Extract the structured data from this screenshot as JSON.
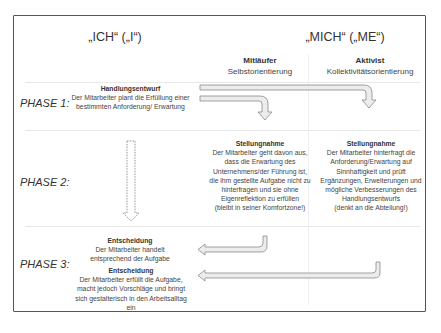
{
  "headers": {
    "ich": "„ICH“ („I“)",
    "mich": "„MICH“ („ME“)"
  },
  "columns": [
    {
      "title": "Mitläufer",
      "subtitle": "Selbstorientierung"
    },
    {
      "title": "Aktivist",
      "subtitle": "Kollektivitätsorientierung"
    }
  ],
  "phases": [
    {
      "label": "PHASE 1:"
    },
    {
      "label": "PHASE 2:"
    },
    {
      "label": "PHASE 3:"
    }
  ],
  "phase1": {
    "title": "Handlungsentwurf",
    "text": "Der Mitarbeiter plant die Erfüllung einer bestimmten Anforderung/ Erwartung"
  },
  "phase2": {
    "mitlaeufer": {
      "title": "Stellungnahme",
      "text": "Der Mitarbeiter geht davon aus, dass die Erwartung des Unternehmens/der Führung ist, die ihm gestellte Aufgabe nicht zu hinterfragen und sie ohne Eigenreflektion zu erfüllen",
      "note": "(bleibt in seiner Komfortzone!)"
    },
    "aktivist": {
      "title": "Stellungnahme",
      "text": "Der Mitarbeiter hinterfragt die Anforderung/Erwartung auf Sinnhaftigkeit und prüft Ergänzungen, Erweiterungen und mögliche Verbesserungen des Handlungsentwurfs",
      "note": "(denkt an die Abteilung!)"
    }
  },
  "phase3": {
    "decision1": {
      "title": "Entscheidung",
      "text": "Der Mitarbeiter handelt entsprechend der Aufgabe"
    },
    "decision2": {
      "title": "Entscheidung",
      "text": "Der Mitarbeiter erfüllt die Aufgabe, macht jedoch Vorschläge und bringt sich gestalterisch in den Arbeitsalltag ein"
    }
  },
  "colors": {
    "frame": "#555555",
    "arrow_fill": "#ececec",
    "arrow_stroke": "#8a8a8a"
  }
}
